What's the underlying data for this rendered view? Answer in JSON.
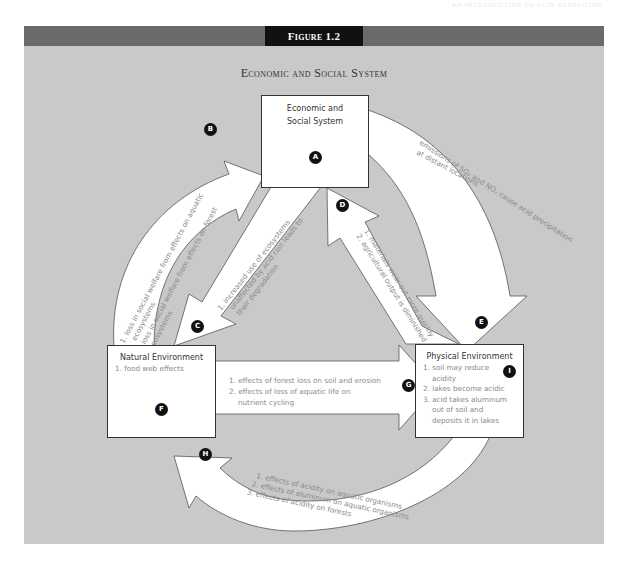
{
  "page": {
    "running_header": "AN INTRODUCTION TO ACID DEPOSITION"
  },
  "figure": {
    "label": "Figure 1.2",
    "title": "Economic and Social System",
    "colors": {
      "background": "#c9c9c9",
      "band": "#6a6a6a",
      "tab": "#111111",
      "box_border": "#333333",
      "arrow_fill": "#ffffff",
      "text_gray": "#888888"
    }
  },
  "nodes": {
    "economic": {
      "title_line1": "Economic and",
      "title_line2": "Social System",
      "badge": "A"
    },
    "natural": {
      "title": "Natural Environment",
      "items": [
        "1. food web effects"
      ],
      "badge": "F"
    },
    "physical": {
      "title": "Physical Environment",
      "items": [
        "1. soil may reduce acidity",
        "2. lakes become acidic",
        "3. acid takes aluminum out of soil and deposits it in lakes"
      ],
      "badge": "I"
    }
  },
  "arrows": {
    "B": {
      "badge": "B",
      "from": "Natural Environment",
      "to": "Economic and Social System",
      "line1": "1. loss in social welfare from effects on aquatic",
      "line2": "ecosystems",
      "line3": "2. loss in social welfare from effects on forest",
      "line4": "ecosystems"
    },
    "C": {
      "badge": "C",
      "from": "Economic and Social System",
      "to": "Natural Environment",
      "line1": "1. increased use of ecosystems",
      "line2": "unaffected by acid rain leads to",
      "line3": "their degradation"
    },
    "D": {
      "badge": "D",
      "from": "Physical Environment",
      "to": "Economic and Social System",
      "line1": "1. materials wear out more quickly",
      "line2": "2. agricultural output is diminished"
    },
    "E": {
      "badge": "E",
      "from": "Economic and Social System",
      "to": "Physical Environment",
      "line1": "emissions of SO₂ and NOₓ cause acid precipitation",
      "line2": "at distant locations"
    },
    "G": {
      "badge": "G",
      "from": "Natural Environment",
      "to": "Physical Environment",
      "items": [
        "1. effects of forest loss on soil and erosion",
        "2. effects of loss of aquatic life on",
        "nutrient cycling"
      ]
    },
    "H": {
      "badge": "H",
      "from": "Physical Environment",
      "to": "Natural Environment",
      "line1": "1. effects of acidity on aquatic organisms",
      "line2": "2. effects of aluminum on aquatic organisms",
      "line3": "3. effects of acidity on forests"
    }
  }
}
